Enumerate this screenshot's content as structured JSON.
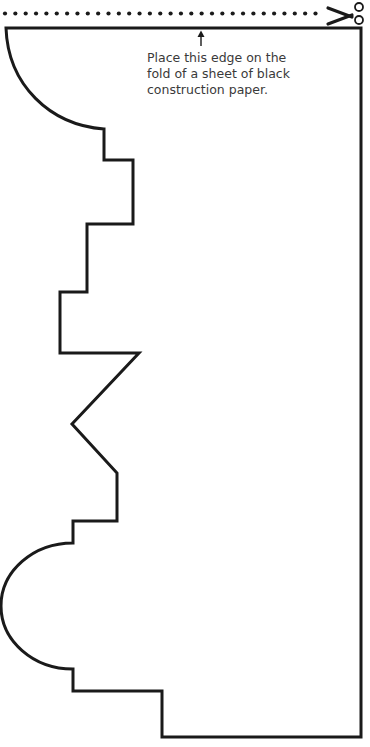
{
  "template": {
    "title": "Cut-out template",
    "instruction_lines": [
      "Place this edge on the",
      "fold of a sheet of black",
      "construction paper."
    ],
    "cut_line": {
      "style": "dotted",
      "dot_count": 31,
      "icon": "scissors-icon"
    },
    "fold_arrow": {
      "icon": "arrow-up-icon",
      "points_to": "fold edge"
    },
    "colors": {
      "line": "#1a1a1a",
      "text": "#3a3a3a",
      "background": "#ffffff"
    }
  }
}
